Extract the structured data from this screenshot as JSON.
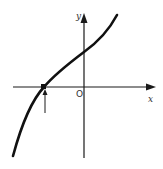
{
  "figure": {
    "axes": {
      "x_label": "x",
      "y_label": "y",
      "origin_label": "O"
    },
    "curve": {
      "shape": "monotonic increasing cubic-like",
      "root_position": "negative x",
      "y_intercept": "positive"
    },
    "annotations": {
      "root_arrow": "upward arrow pointing to root on x-axis"
    },
    "colors": {
      "line": "#111111",
      "background": "#ffffff"
    }
  }
}
